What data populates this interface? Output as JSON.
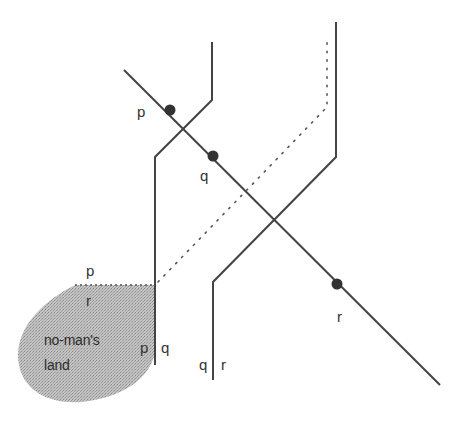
{
  "diagram": {
    "colors": {
      "line": "#444444",
      "dot": "#333333",
      "region_fill": "#bdbdbd",
      "background": "#ffffff"
    },
    "lines": {
      "left_bent": {
        "points": "212,42 212,100 155,157 155,365"
      },
      "right_bent": {
        "points": "336,22 336,157 213,282 213,380"
      },
      "trajectory": {
        "points": "124,70 440,385"
      },
      "dotted_path": {
        "points": "155,285 327,107 327,42"
      }
    },
    "points": [
      {
        "name": "p",
        "cx": 170,
        "cy": 110
      },
      {
        "name": "q",
        "cx": 213,
        "cy": 156
      },
      {
        "name": "r",
        "cx": 337,
        "cy": 284
      }
    ],
    "labels": {
      "dot_p": "p",
      "dot_q": "q",
      "dot_r": "r",
      "top_p": "p",
      "region_r": "r",
      "left_line_p": "p",
      "left_line_q": "q",
      "right_line_q": "q",
      "right_line_r": "r",
      "region_line1": "no-man's",
      "region_line2": "land"
    },
    "region": {
      "name": "no-man's land"
    }
  }
}
